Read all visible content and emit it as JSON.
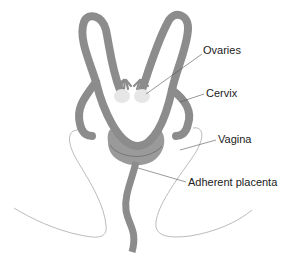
{
  "diagram": {
    "colors": {
      "organ_fill": "#8c8c8c",
      "placenta_fill": "#9a9a9a",
      "ovary_fill": "#e6e6e6",
      "outline": "#999999",
      "leader": "#555555",
      "text": "#222222"
    },
    "labels": [
      {
        "id": "ovaries",
        "text": "Ovaries"
      },
      {
        "id": "cervix",
        "text": "Cervix"
      },
      {
        "id": "vagina",
        "text": "Vagina"
      },
      {
        "id": "placenta",
        "text": "Adherent placenta"
      }
    ]
  }
}
